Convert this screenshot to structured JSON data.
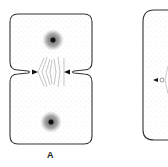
{
  "figure": {
    "panels": [
      {
        "label": "A",
        "description": "Dividing cell with cleavage furrow and two nuclei"
      },
      {
        "label": "",
        "description": "Second dividing cell (partially visible)"
      }
    ]
  },
  "colors": {
    "outline": "#333333",
    "stipple": "#9a9a9a",
    "nucleus": "#111111",
    "background": "#ffffff"
  }
}
